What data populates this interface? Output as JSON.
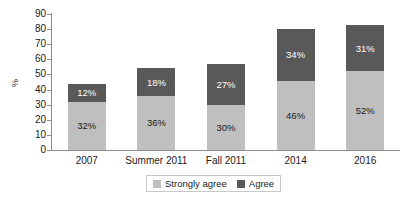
{
  "chart_data": {
    "type": "bar",
    "subtype": "stacked-bar",
    "title": "",
    "xlabel": "",
    "ylabel": "%",
    "ylim": [
      0,
      90
    ],
    "ytick_step": 10,
    "yticks": [
      "90",
      "80",
      "70",
      "60",
      "50",
      "40",
      "30",
      "20",
      "10",
      "0"
    ],
    "grid": false,
    "legend_position": "bottom-center",
    "categories": [
      "2007",
      "Summer 2011",
      "Fall 2011",
      "2014",
      "2016"
    ],
    "series": [
      {
        "name": "Strongly agree",
        "color": "#bfbfbf",
        "stack_position": "bottom",
        "values": [
          32,
          36,
          30,
          46,
          52
        ],
        "labels": [
          "32%",
          "36%",
          "30%",
          "46%",
          "52%"
        ]
      },
      {
        "name": "Agree",
        "color": "#595959",
        "stack_position": "top",
        "values": [
          12,
          18,
          27,
          34,
          31
        ],
        "labels": [
          "12%",
          "18%",
          "27%",
          "34%",
          "31%"
        ]
      }
    ],
    "totals": [
      44,
      54,
      57,
      80,
      83
    ]
  },
  "axis": {
    "y_label": "%"
  },
  "legend": {
    "items": [
      {
        "label": "Strongly agree",
        "color": "#bfbfbf"
      },
      {
        "label": "Agree",
        "color": "#595959"
      }
    ]
  },
  "colors": {
    "strongly_agree": "#bfbfbf",
    "agree": "#595959",
    "axis": "#8c8c8c",
    "text": "#1a1a1a",
    "legend_border": "#c9c9c9",
    "background": "#ffffff"
  }
}
